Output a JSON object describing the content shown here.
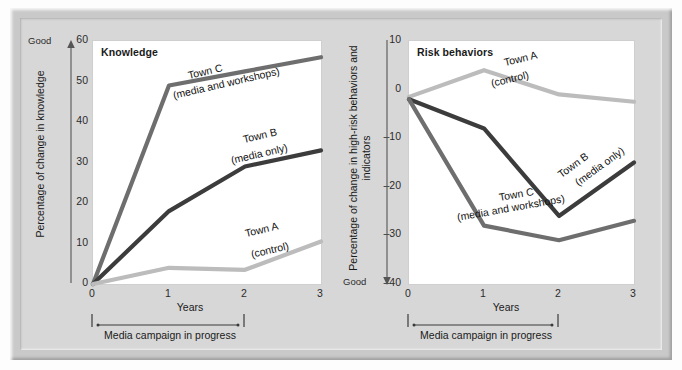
{
  "chart_data": [
    {
      "type": "line",
      "id": "knowledge",
      "title": "Knowledge",
      "xlabel": "Years",
      "ylabel": "Percentage of change in knowledge",
      "x": [
        0,
        1,
        2,
        3
      ],
      "xticks": [
        "0",
        "1",
        "2",
        "3"
      ],
      "xlim": [
        0,
        3
      ],
      "ylim": [
        0,
        60
      ],
      "yticks": [
        "0",
        "10",
        "20",
        "30",
        "40",
        "50",
        "60"
      ],
      "ytickvalues": [
        0,
        10,
        20,
        30,
        40,
        50,
        60
      ],
      "direction_label": "Good",
      "direction": "up",
      "grid": false,
      "legend": "inline-annotations",
      "annotation": "Media campaign in progress",
      "annotation_span": [
        0,
        2
      ],
      "series": [
        {
          "name": "Town C",
          "sub": "(media and workshops)",
          "color": "#6e6e6e",
          "values": [
            0,
            49,
            52.5,
            56
          ]
        },
        {
          "name": "Town B",
          "sub": "(media only)",
          "color": "#3c3c3c",
          "values": [
            0,
            18,
            29,
            33
          ]
        },
        {
          "name": "Town A",
          "sub": "(control)",
          "color": "#bcbcbc",
          "values": [
            0,
            4,
            3.5,
            10.5
          ]
        }
      ]
    },
    {
      "type": "line",
      "id": "risk-behaviors",
      "title": "Risk behaviors",
      "xlabel": "Years",
      "ylabel": "Percentage of change in high-risk behaviors and indicators",
      "x": [
        0,
        1,
        2,
        3
      ],
      "xticks": [
        "0",
        "1",
        "2",
        "3"
      ],
      "xlim": [
        0,
        3
      ],
      "ylim": [
        -40,
        10
      ],
      "yticks": [
        "10",
        "0",
        "–10",
        "–20",
        "–30",
        "–40"
      ],
      "ytickvalues": [
        10,
        0,
        -10,
        -20,
        -30,
        -40
      ],
      "direction_label": "Good",
      "direction": "down",
      "grid": false,
      "legend": "inline-annotations",
      "annotation": "Media campaign in progress",
      "annotation_span": [
        0,
        2
      ],
      "series": [
        {
          "name": "Town A",
          "sub": "(control)",
          "color": "#bcbcbc",
          "values": [
            -1.5,
            4,
            -1,
            -2.5
          ]
        },
        {
          "name": "Town B",
          "sub": "(media only)",
          "color": "#3c3c3c",
          "values": [
            -2,
            -8,
            -26,
            -15
          ]
        },
        {
          "name": "Town C",
          "sub": "(media and workshops)",
          "color": "#6e6e6e",
          "values": [
            -2,
            -28,
            -31,
            -27
          ]
        }
      ]
    }
  ],
  "colors": {
    "town_a": "#bcbcbc",
    "town_b": "#3c3c3c",
    "town_c": "#6e6e6e",
    "background": "#d7d7d7",
    "frame": "#c9c9c9",
    "plot_background": "#ffffff",
    "text": "#1a1a1a"
  }
}
